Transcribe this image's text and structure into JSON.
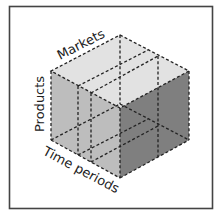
{
  "diagram": {
    "type": "data-cube",
    "labels": {
      "top": "Markets",
      "left": "Products",
      "bottom": "Time periods"
    },
    "colors": {
      "top_face": "#e2e2e2",
      "left_face": "#bdbdbd",
      "right_face": "#7f7f7f",
      "edges": "#222222",
      "frame": "#444444"
    }
  }
}
